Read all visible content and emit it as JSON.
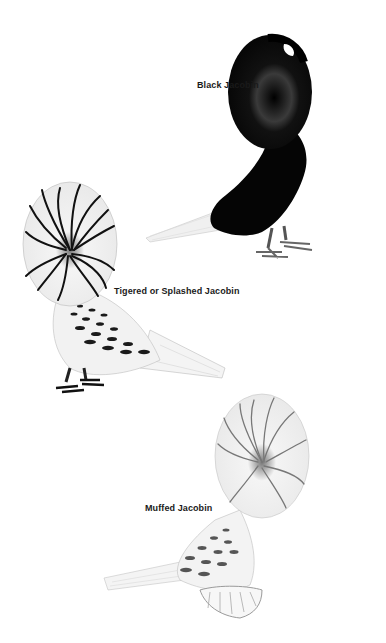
{
  "plate": {
    "background": "#ffffff",
    "birds": [
      {
        "id": "black",
        "label": "Black Jacobin",
        "color": "#0a0a0a"
      },
      {
        "id": "tigered",
        "label": "Tigered or Splashed Jacobin",
        "color": "#1e1e1e"
      },
      {
        "id": "muffed",
        "label": "Muffed Jacobin",
        "color": "#6e6e6e"
      }
    ]
  }
}
